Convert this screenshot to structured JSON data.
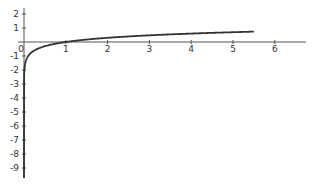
{
  "chart_data": {
    "type": "line",
    "title": "",
    "xlabel": "",
    "ylabel": "",
    "function": "y = log10(x)",
    "xlim": [
      0,
      6.8
    ],
    "ylim": [
      -9.5,
      2.5
    ],
    "grid": false,
    "legend": null,
    "x_ticks": [
      1,
      2,
      3,
      4,
      5,
      6
    ],
    "x_tick_labels": [
      "1",
      "2",
      "3",
      "4",
      "5",
      "6"
    ],
    "y_ticks": [
      2,
      1,
      -1,
      -2,
      -3,
      -4,
      -5,
      -6,
      -7,
      -8,
      -9
    ],
    "y_tick_labels": [
      "2",
      "1",
      "-1",
      "-2",
      "-3",
      "-4",
      "-5",
      "-6",
      "-7",
      "-8",
      "-9"
    ],
    "origin_label": "0",
    "series": [
      {
        "name": "log curve",
        "color": "#333333",
        "x": [
          1e-10,
          0.001,
          0.01,
          0.05,
          0.1,
          0.2,
          0.3,
          0.5,
          0.75,
          1,
          1.5,
          2,
          2.5,
          3,
          3.5,
          4,
          4.5,
          5,
          5.5
        ],
        "y": [
          -10,
          -3,
          -2,
          -1.3,
          -1,
          -0.7,
          -0.52,
          -0.3,
          -0.12,
          0,
          0.18,
          0.3,
          0.4,
          0.48,
          0.54,
          0.6,
          0.65,
          0.7,
          0.74
        ]
      }
    ]
  },
  "axes": {
    "color": "#555555"
  }
}
